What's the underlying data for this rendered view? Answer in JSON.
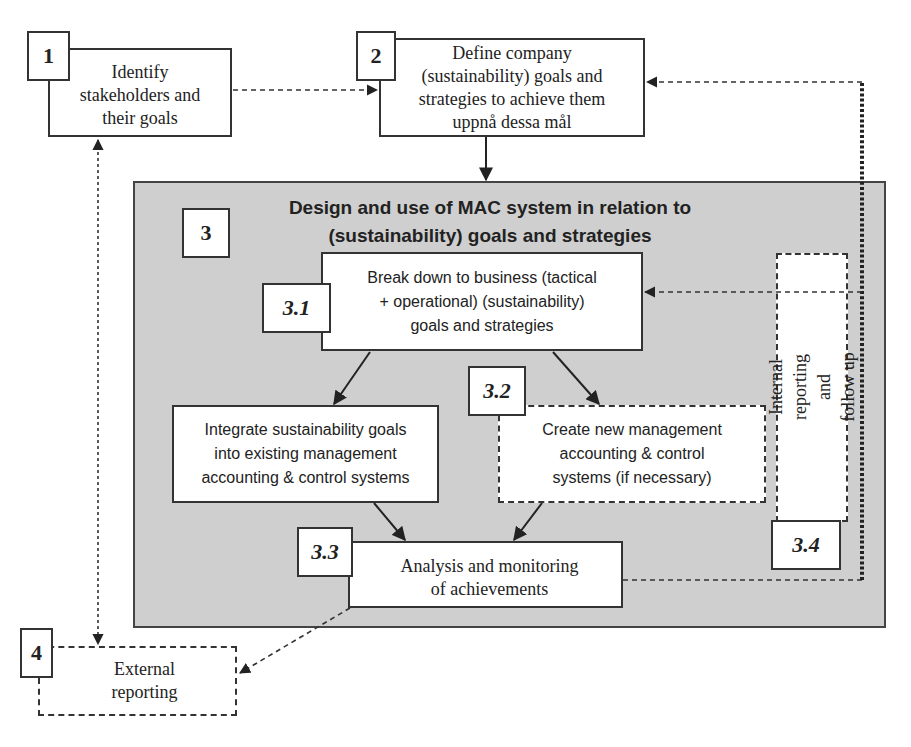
{
  "diagram": {
    "step1": {
      "number": "1",
      "text": "Identify\nstakeholders and\ntheir goals"
    },
    "step2": {
      "number": "2",
      "text": "Define company\n(sustainability) goals and\nstrategies to achieve them\nuppnå dessa mål"
    },
    "step3": {
      "number": "3",
      "title": "Design and use of MAC system in relation to\n(sustainability) goals and strategies"
    },
    "step3_1": {
      "number": "3.1",
      "text": "Break down to business (tactical\n+ operational) (sustainability)\ngoals and strategies"
    },
    "step3_2": {
      "number": "3.2",
      "integrate_text": "Integrate sustainability goals\ninto existing management\naccounting & control systems",
      "create_text": "Create new management\naccounting & control\nsystems (if necessary)"
    },
    "step3_3": {
      "number": "3.3",
      "text": "Analysis and monitoring\nof achievements"
    },
    "step3_4": {
      "number": "3.4",
      "text": "Internal reporting and\nfollow up"
    },
    "step4": {
      "number": "4",
      "text": "External\nreporting"
    },
    "colors": {
      "group_fill": "#cfcfcf",
      "line": "#333333",
      "box_fill": "#ffffff"
    }
  }
}
